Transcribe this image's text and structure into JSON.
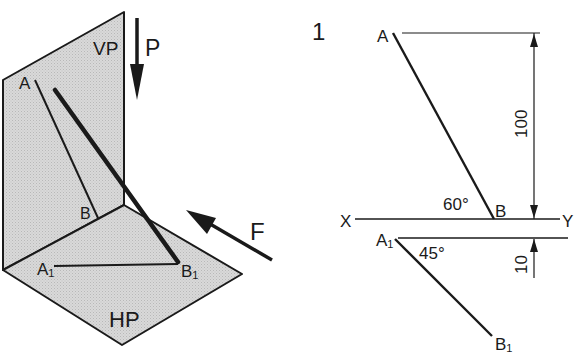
{
  "figure_number": "1",
  "pictorial": {
    "vertical_plane_label": "VP",
    "horizontal_plane_label": "HP",
    "point_a_label": "A",
    "point_b_label": "B",
    "point_a1_label": "A",
    "point_a1_sub": "1",
    "point_b1_label": "B",
    "point_b1_sub": "1",
    "view_direction_p": "P",
    "view_direction_f": "F",
    "plane_fill_color": "#d4d4d4",
    "line_color": "#1a1a1a"
  },
  "orthographic": {
    "point_a_label": "A",
    "point_b_label": "B",
    "point_a1_label": "A",
    "point_a1_sub": "1",
    "point_b1_label": "B",
    "point_b1_sub": "1",
    "reference_x": "X",
    "reference_y": "Y",
    "angle_front": "60°",
    "angle_top": "45°",
    "dimension_height": "100",
    "dimension_offset": "10"
  }
}
